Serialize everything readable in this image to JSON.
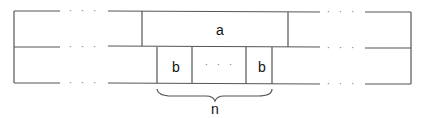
{
  "diagram": {
    "type": "memory-layout",
    "rows": 2,
    "ellipsis": "· · ·",
    "labels": {
      "a": "a",
      "b_first": "b",
      "b_middle_ellipsis": "· · ·",
      "b_last": "b",
      "brace": "n"
    },
    "colors": {
      "line": "#555555",
      "text": "#111111",
      "dots": "#777777",
      "background": "#ffffff"
    }
  }
}
